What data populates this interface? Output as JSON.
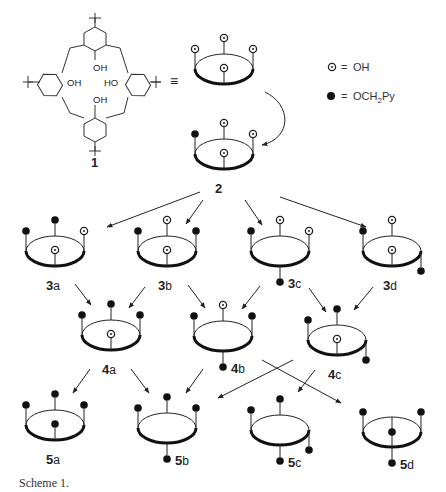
{
  "caption": "Scheme 1.",
  "legend": {
    "oh": {
      "symbol": "open-circle-dot",
      "equals": "=",
      "label": "OH"
    },
    "py": {
      "symbol": "filled-circle",
      "equals": "=",
      "label_main": "OCH",
      "label_sub": "2",
      "label_tail": "Py"
    }
  },
  "compound1": {
    "label": "1",
    "oh_labels": [
      "OH",
      "OH",
      "HO",
      "OH"
    ],
    "equiv": "≡"
  },
  "colors": {
    "ink": "#222222",
    "background": "#ffffff"
  },
  "molecules": [
    {
      "id": "1-cone",
      "cx": 224,
      "cy": 69,
      "label": "",
      "sub": "",
      "back": "oh",
      "left": "oh",
      "right": "oh",
      "front": "oh"
    },
    {
      "id": "2",
      "cx": 224,
      "cy": 154,
      "label": "2",
      "sub": "",
      "back": "oh",
      "left": "py",
      "right": "oh",
      "front": "oh"
    },
    {
      "id": "3a",
      "cx": 55,
      "cy": 251,
      "label": "3",
      "sub": "a",
      "back": "py",
      "left": "py",
      "right": "oh",
      "front": "oh"
    },
    {
      "id": "3b",
      "cx": 167,
      "cy": 251,
      "label": "3",
      "sub": "b",
      "back": "oh",
      "left": "py",
      "right": "py",
      "front": "oh"
    },
    {
      "id": "3c",
      "cx": 280,
      "cy": 251,
      "label": "3",
      "sub": "c",
      "back": "oh",
      "left": "py",
      "right": "oh",
      "front": "py-down"
    },
    {
      "id": "3d",
      "cx": 392,
      "cy": 251,
      "label": "3",
      "sub": "d",
      "back": "oh",
      "left": "py",
      "right": "py-down",
      "front": "oh"
    },
    {
      "id": "4a",
      "cx": 111,
      "cy": 335,
      "label": "4",
      "sub": "a",
      "back": "py",
      "left": "py",
      "right": "py",
      "front": "oh"
    },
    {
      "id": "4b",
      "cx": 223,
      "cy": 336,
      "label": "4",
      "sub": "b",
      "back": "oh",
      "left": "py",
      "right": "py",
      "front": "py-down"
    },
    {
      "id": "4c",
      "cx": 337,
      "cy": 340,
      "label": "4",
      "sub": "c",
      "back": "py",
      "left": "py",
      "right": "py-down",
      "front": "oh"
    },
    {
      "id": "5a",
      "cx": 55,
      "cy": 425,
      "label": "5",
      "sub": "a",
      "back": "py",
      "left": "py",
      "right": "py",
      "front": "py"
    },
    {
      "id": "5b",
      "cx": 167,
      "cy": 428,
      "label": "5",
      "sub": "b",
      "back": "py",
      "left": "py",
      "right": "py",
      "front": "py-down"
    },
    {
      "id": "5c",
      "cx": 280,
      "cy": 430,
      "label": "5",
      "sub": "c",
      "back": "py",
      "left": "py",
      "right": "py-down",
      "front": "py-down"
    },
    {
      "id": "5d",
      "cx": 392,
      "cy": 432,
      "label": "5",
      "sub": "d",
      "back": "none",
      "left": "py",
      "right": "py",
      "front": "py-long"
    }
  ],
  "arrows": [
    {
      "x1": 48,
      "y1": 95,
      "x2": 0,
      "y2": 0,
      "curve": true
    },
    {
      "x1": 200,
      "y1": 192,
      "x2": 107,
      "y2": 227
    },
    {
      "x1": 203,
      "y1": 200,
      "x2": 186,
      "y2": 224
    },
    {
      "x1": 245,
      "y1": 200,
      "x2": 262,
      "y2": 225
    },
    {
      "x1": 280,
      "y1": 197,
      "x2": 366,
      "y2": 227
    },
    {
      "x1": 75,
      "y1": 284,
      "x2": 91,
      "y2": 305
    },
    {
      "x1": 145,
      "y1": 287,
      "x2": 129,
      "y2": 308
    },
    {
      "x1": 188,
      "y1": 285,
      "x2": 205,
      "y2": 308
    },
    {
      "x1": 260,
      "y1": 286,
      "x2": 242,
      "y2": 309
    },
    {
      "x1": 309,
      "y1": 288,
      "x2": 326,
      "y2": 312
    },
    {
      "x1": 373,
      "y1": 287,
      "x2": 354,
      "y2": 310
    },
    {
      "x1": 90,
      "y1": 369,
      "x2": 73,
      "y2": 393
    },
    {
      "x1": 131,
      "y1": 369,
      "x2": 149,
      "y2": 393
    },
    {
      "x1": 203,
      "y1": 369,
      "x2": 186,
      "y2": 393
    },
    {
      "x1": 293,
      "y1": 360,
      "x2": 218,
      "y2": 398
    },
    {
      "x1": 262,
      "y1": 360,
      "x2": 341,
      "y2": 403
    },
    {
      "x1": 315,
      "y1": 370,
      "x2": 298,
      "y2": 392
    }
  ]
}
